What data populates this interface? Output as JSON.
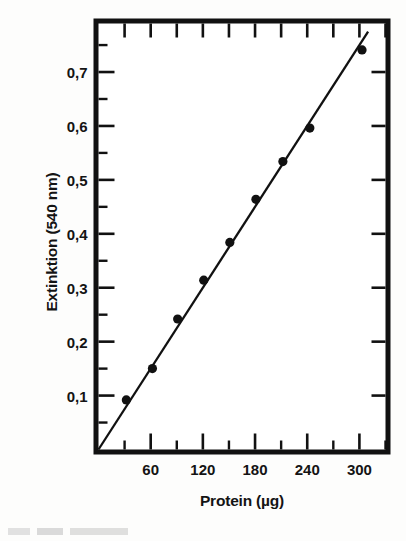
{
  "chart_data": {
    "type": "scatter",
    "title": "",
    "subtitle": "",
    "xlabel": "Protein (µg)",
    "ylabel": "Extinktion (540 nm)",
    "xlim": [
      0,
      330
    ],
    "ylim": [
      0,
      0.79
    ],
    "grid": false,
    "legend": null,
    "decimal_separator": ",",
    "x_ticks_major": [
      60,
      120,
      180,
      240,
      300
    ],
    "x_tick_labels": [
      "60",
      "120",
      "180",
      "240",
      "300"
    ],
    "x_minor_tick_count_between": 1,
    "y_ticks_major": [
      0.1,
      0.2,
      0.3,
      0.4,
      0.5,
      0.6,
      0.7
    ],
    "y_tick_labels": [
      "0,1",
      "0,2",
      "0,3",
      "0,4",
      "0,5",
      "0,6",
      "0,7"
    ],
    "y_minor_tick_count_between": 1,
    "series": [
      {
        "name": "Messpunkte",
        "type": "scatter",
        "marker": "filled-circle",
        "color": "#111111",
        "x": [
          32,
          62,
          91,
          121,
          151,
          181,
          212,
          243,
          303
        ],
        "y": [
          0.092,
          0.15,
          0.242,
          0.314,
          0.384,
          0.464,
          0.534,
          0.596,
          0.741
        ]
      },
      {
        "name": "Regressionsgerade",
        "type": "line",
        "color": "#111111",
        "x": [
          0,
          310
        ],
        "y": [
          0.0,
          0.775
        ]
      }
    ],
    "annotations": []
  },
  "axes": {
    "frame_color": "#111111",
    "tick_color": "#111111",
    "background": "#ffffff"
  },
  "icons": {
    "data_point": "filled-circle-marker",
    "fit_line": "straight-line"
  }
}
